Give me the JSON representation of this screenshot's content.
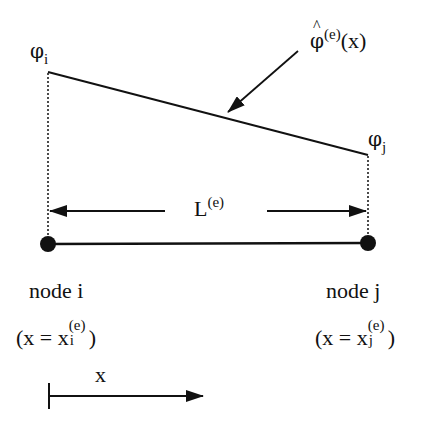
{
  "diagram": {
    "title": "",
    "function_label": {
      "symbol": "φ",
      "hat": "^",
      "superscript": "(e)",
      "argument": "(x)"
    },
    "node_i": {
      "value_symbol": "φ",
      "value_subscript": "i",
      "name": "node i",
      "coord_prefix": "(x = x",
      "coord_subscript": "i",
      "coord_superscript": "(e)",
      "coord_suffix": ")"
    },
    "node_j": {
      "value_symbol": "φ",
      "value_subscript": "j",
      "name": "node j",
      "coord_prefix": "(x = x",
      "coord_subscript": "j",
      "coord_superscript": "(e)",
      "coord_suffix": ")"
    },
    "element_length": {
      "symbol": "L",
      "superscript": "(e)"
    },
    "axis": {
      "label": "x"
    },
    "colors": {
      "ink": "#111111",
      "background": "#ffffff"
    }
  }
}
